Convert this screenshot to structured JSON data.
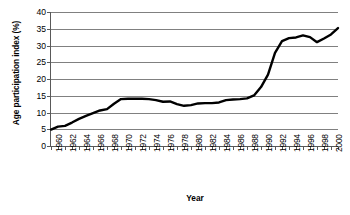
{
  "chart_data": {
    "type": "line",
    "title": "",
    "xlabel": "Year",
    "ylabel": "Age participation index (%)",
    "xlim": [
      1960,
      2001
    ],
    "ylim": [
      0,
      40
    ],
    "yticks": [
      0,
      5,
      10,
      15,
      20,
      25,
      30,
      35,
      40
    ],
    "xticks": [
      1960,
      1962,
      1964,
      1966,
      1968,
      1970,
      1972,
      1974,
      1976,
      1978,
      1980,
      1982,
      1984,
      1986,
      1988,
      1990,
      1992,
      1994,
      1996,
      1998,
      2000
    ],
    "xtick_labels": [
      "1960",
      "1962",
      "1964",
      "1966",
      "1968",
      "1970",
      "1972",
      "1974",
      "1976",
      "1978",
      "1980",
      "1982",
      "1984",
      "1986",
      "1988",
      "1990",
      "1992",
      "1994",
      "1996",
      "1998",
      "2000"
    ],
    "grid": "horizontal",
    "legend": "none",
    "line_color": "#000000",
    "line_width": 2.4,
    "x": [
      1960,
      1961,
      1962,
      1963,
      1964,
      1965,
      1966,
      1967,
      1968,
      1969,
      1970,
      1971,
      1972,
      1973,
      1974,
      1975,
      1976,
      1977,
      1978,
      1979,
      1980,
      1981,
      1982,
      1983,
      1984,
      1985,
      1986,
      1987,
      1988,
      1989,
      1990,
      1991,
      1992,
      1993,
      1994,
      1995,
      1996,
      1997,
      1998,
      1999,
      2000,
      2001
    ],
    "values": [
      4.9,
      5.8,
      6.0,
      7.0,
      8.1,
      9.0,
      9.8,
      10.6,
      11.0,
      12.6,
      14.0,
      14.1,
      14.1,
      14.1,
      14.0,
      13.7,
      13.2,
      13.3,
      12.5,
      12.0,
      12.2,
      12.7,
      12.8,
      12.8,
      13.0,
      13.7,
      13.9,
      14.0,
      14.2,
      15.1,
      17.6,
      21.3,
      27.8,
      31.3,
      32.2,
      32.4,
      33.0,
      32.5,
      31.0,
      32.1,
      33.3,
      35.2
    ],
    "series_name": "Age participation index",
    "axis_color": "#595959",
    "gridline_color": "#808080",
    "background": "#ffffff"
  }
}
